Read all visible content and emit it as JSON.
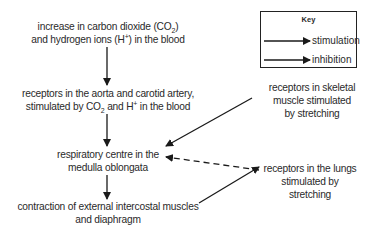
{
  "diagram": {
    "nodes": {
      "co2_increase": {
        "line1_pre": "increase in carbon dioxide (CO",
        "line1_sub": "2",
        "line1_post": ")",
        "line2_pre": "and hydrogen ions (H",
        "line2_sup": "+",
        "line2_post": ") in the blood"
      },
      "aorta_receptors": {
        "line1": "receptors in the aorta and carotid artery,",
        "line2_pre": "stimulated by CO",
        "line2_sub": "2",
        "line2_mid": " and H",
        "line2_sup": "+",
        "line2_post": " in the blood"
      },
      "respiratory_centre": {
        "line1": "respiratory centre in the",
        "line2": "medulla oblongata"
      },
      "contraction": {
        "line1": "contraction of external intercostal muscles",
        "line2": "and diaphragm"
      },
      "skeletal_receptors": {
        "line1": "receptors in skeletal",
        "line2": "muscle stimulated",
        "line3": "by stretching"
      },
      "lung_receptors": {
        "line1": "receptors in the lungs",
        "line2": "stimulated by",
        "line3": "stretching"
      }
    },
    "edges": [
      {
        "from": "co2_increase",
        "to": "aorta_receptors",
        "type": "stimulation"
      },
      {
        "from": "aorta_receptors",
        "to": "respiratory_centre",
        "type": "stimulation"
      },
      {
        "from": "respiratory_centre",
        "to": "contraction",
        "type": "stimulation"
      },
      {
        "from": "skeletal_receptors",
        "to": "respiratory_centre",
        "type": "stimulation"
      },
      {
        "from": "contraction",
        "to": "lung_receptors",
        "type": "stimulation"
      },
      {
        "from": "lung_receptors",
        "to": "respiratory_centre",
        "type": "inhibition"
      }
    ],
    "key": {
      "title": "Key",
      "stimulation": "stimulation",
      "inhibition": "inhibition"
    },
    "colors": {
      "line": "#1a1a1a",
      "text": "#2a2a2a"
    }
  }
}
